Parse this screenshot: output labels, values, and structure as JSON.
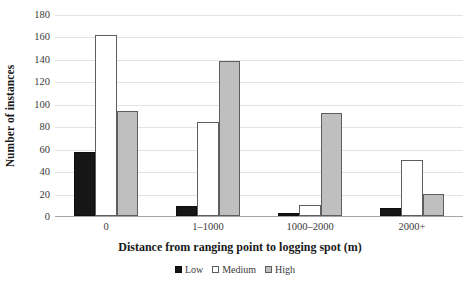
{
  "chart_data": {
    "type": "bar",
    "title": "",
    "xlabel": "Distance from ranging point to logging spot (m)",
    "ylabel": "Number of instances",
    "categories": [
      "0",
      "1–1000",
      "1000–2000",
      "2000+"
    ],
    "series": [
      {
        "name": "Low",
        "values": [
          57,
          9,
          3,
          7
        ],
        "color": "#161616"
      },
      {
        "name": "Medium",
        "values": [
          161,
          84,
          10,
          50
        ],
        "color": "#ffffff"
      },
      {
        "name": "High",
        "values": [
          94,
          138,
          92,
          20
        ],
        "color": "#bfbfbf"
      }
    ],
    "ylim": [
      0,
      180
    ],
    "yticks": [
      0,
      20,
      40,
      60,
      80,
      100,
      120,
      140,
      160,
      180
    ],
    "ytick_labels": [
      "0",
      "20",
      "40",
      "60",
      "80",
      "100",
      "120",
      "140",
      "160",
      "180"
    ],
    "grid": true,
    "grid_axis": "y",
    "legend_position": "bottom",
    "legend_entries": [
      "Low",
      "Medium",
      "High"
    ]
  }
}
